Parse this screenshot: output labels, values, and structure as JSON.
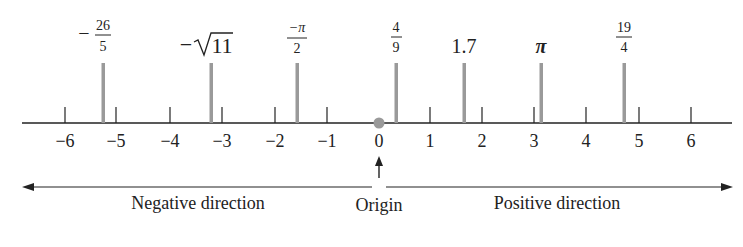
{
  "diagram": {
    "type": "number-line",
    "axis": {
      "min": -6,
      "max": 6,
      "ticks": [
        -6,
        -5,
        -4,
        -3,
        -2,
        -1,
        0,
        1,
        2,
        3,
        4,
        5,
        6
      ],
      "tick_labels": [
        "−6",
        "−5",
        "−4",
        "−3",
        "−2",
        "−1",
        "0",
        "1",
        "2",
        "3",
        "4",
        "5",
        "6"
      ]
    },
    "origin": {
      "value": 0,
      "label": "Origin"
    },
    "directions": {
      "negative_label": "Negative direction",
      "positive_label": "Positive direction"
    },
    "marked_points": [
      {
        "id": "neg-26-over-5",
        "expr": "−26/5",
        "value": -5.2,
        "kind": "fraction",
        "sign": "−",
        "numerator": "26",
        "denominator": "5"
      },
      {
        "id": "neg-sqrt-11",
        "expr": "−√11",
        "value": -3.317,
        "kind": "sqrt",
        "sign": "−",
        "radicand": "11"
      },
      {
        "id": "neg-pi-over-2",
        "expr": "−π/2",
        "value": -1.571,
        "kind": "fraction",
        "sign": "",
        "numerator": "−π",
        "denominator": "2"
      },
      {
        "id": "four-ninths",
        "expr": "4/9",
        "value": 0.444,
        "kind": "fraction",
        "sign": "",
        "numerator": "4",
        "denominator": "9"
      },
      {
        "id": "one-point-seven",
        "expr": "1.7",
        "value": 1.7,
        "kind": "plain",
        "text": "1.7"
      },
      {
        "id": "pi",
        "expr": "π",
        "value": 3.1416,
        "kind": "plain",
        "text": "π"
      },
      {
        "id": "nineteen-fourths",
        "expr": "19/4",
        "value": 4.75,
        "kind": "fraction",
        "sign": "",
        "numerator": "19",
        "denominator": "4"
      }
    ],
    "colors": {
      "axis": "#222222",
      "marker_bar": "#9a9a9a",
      "origin_dot": "#9a9a9a",
      "text": "#222222"
    }
  }
}
